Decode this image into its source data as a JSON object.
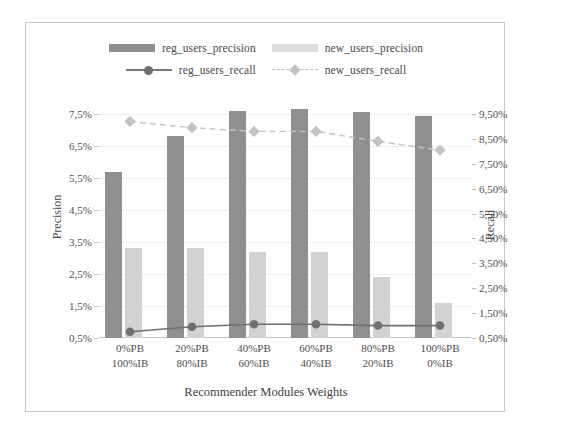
{
  "chart_data": {
    "type": "bar",
    "title": "",
    "xlabel": "Recommender Modules Weights",
    "ylabel": "Precision",
    "ylabel_secondary": "Recall",
    "grid": true,
    "legend_position": "top",
    "categories": [
      "0%PB|100%IB",
      "20%PB|80%IB",
      "40%PB|60%IB",
      "60%PB|40%IB",
      "80%PB|20%IB",
      "100%PB|0%IB"
    ],
    "categories_lines": [
      [
        "0%PB",
        "100%IB"
      ],
      [
        "20%PB",
        "80%IB"
      ],
      [
        "40%PB",
        "60%IB"
      ],
      [
        "60%PB",
        "40%IB"
      ],
      [
        "80%PB",
        "20%IB"
      ],
      [
        "100%PB",
        "0%IB"
      ]
    ],
    "ylim": [
      0.5,
      7.5
    ],
    "yticks": [
      "7,5%",
      "6,5%",
      "5,5%",
      "4,5%",
      "3,5%",
      "2,5%",
      "1,5%",
      "0,5%"
    ],
    "ytick_values": [
      7.5,
      6.5,
      5.5,
      4.5,
      3.5,
      2.5,
      1.5,
      0.5
    ],
    "ylim_secondary": [
      0.5,
      9.5
    ],
    "yticks_secondary": [
      "9,50%",
      "8,50%",
      "7,50%",
      "6,50%",
      "5,50%",
      "4,50%",
      "3,50%",
      "2,50%",
      "1,50%",
      "0,50%"
    ],
    "ytick_values_secondary": [
      9.5,
      8.5,
      7.5,
      6.5,
      5.5,
      4.5,
      3.5,
      2.5,
      1.5,
      0.5
    ],
    "series": [
      {
        "name": "reg_users_precision",
        "kind": "bar",
        "axis": "left",
        "color": "#8f8f8f",
        "values": [
          5.7,
          6.8,
          7.6,
          7.65,
          7.55,
          7.45
        ]
      },
      {
        "name": "new_users_precision",
        "kind": "bar",
        "axis": "left",
        "color": "#e2e2e2",
        "values": [
          3.3,
          3.3,
          3.2,
          3.2,
          2.4,
          1.6
        ]
      },
      {
        "name": "reg_users_recall",
        "kind": "line",
        "axis": "right",
        "color": "#6f6f6f",
        "marker": "circle",
        "linestyle": "solid",
        "values": [
          0.75,
          0.95,
          1.05,
          1.05,
          1.0,
          1.0
        ]
      },
      {
        "name": "new_users_recall",
        "kind": "line",
        "axis": "right",
        "color": "#c3c3c3",
        "marker": "diamond",
        "linestyle": "dashed",
        "values": [
          9.2,
          8.95,
          8.8,
          8.8,
          8.4,
          8.05
        ]
      }
    ]
  },
  "legend": {
    "rows": [
      [
        {
          "label": "reg_users_precision",
          "swatch": "bar-dark"
        },
        {
          "label": "new_users_precision",
          "swatch": "bar-light"
        }
      ],
      [
        {
          "label": "reg_users_recall",
          "swatch": "line-solid-circle"
        },
        {
          "label": "new_users_recall",
          "swatch": "line-dashed-diamond"
        }
      ]
    ]
  }
}
